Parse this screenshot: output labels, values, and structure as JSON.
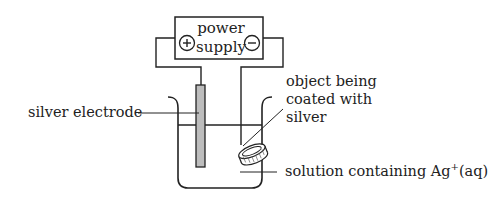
{
  "diagram": {
    "type": "electroplating-setup",
    "power_supply": {
      "line1": "power",
      "line2": "supply",
      "positive_symbol": "+",
      "negative_symbol": "−"
    },
    "labels": {
      "silver_electrode": "silver electrode",
      "object_line1": "object being",
      "object_line2": "coated with",
      "object_line3": "silver",
      "solution_main": "solution containing Ag",
      "solution_sup": "+",
      "solution_tail": "(aq)"
    },
    "colors": {
      "line": "#222222",
      "electrode_fill": "#bdbdbd",
      "background": "#ffffff"
    }
  }
}
